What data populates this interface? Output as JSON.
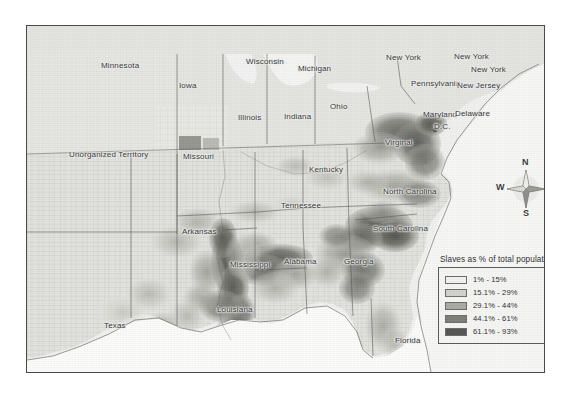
{
  "map": {
    "title": "Slaves as % of total population",
    "frame_border_color": "#4a4a4a",
    "land_base_color": "#e8e8e4",
    "water_color": "#fbfbfa",
    "labels": [
      {
        "name": "minnesota",
        "text": "Minnesota",
        "x": 74,
        "y": 35
      },
      {
        "name": "wisconsin",
        "text": "Wisconsin",
        "x": 219,
        "y": 31
      },
      {
        "name": "michigan",
        "text": "Michigan",
        "x": 271,
        "y": 38
      },
      {
        "name": "new-york-west",
        "text": "New York",
        "x": 359,
        "y": 27
      },
      {
        "name": "new-york-center",
        "text": "New York",
        "x": 427,
        "y": 26
      },
      {
        "name": "new-york-east",
        "text": "New York",
        "x": 444,
        "y": 39
      },
      {
        "name": "iowa",
        "text": "Iowa",
        "x": 152,
        "y": 55
      },
      {
        "name": "pennsylvania",
        "text": "Pennsylvania",
        "x": 384,
        "y": 53
      },
      {
        "name": "new-jersey",
        "text": "New Jersey",
        "x": 430,
        "y": 55
      },
      {
        "name": "illinois",
        "text": "Illinois",
        "x": 211,
        "y": 87
      },
      {
        "name": "indiana",
        "text": "Indiana",
        "x": 257,
        "y": 86
      },
      {
        "name": "ohio",
        "text": "Ohio",
        "x": 303,
        "y": 76
      },
      {
        "name": "maryland",
        "text": "Maryland",
        "x": 396,
        "y": 84
      },
      {
        "name": "delaware",
        "text": "Delaware",
        "x": 428,
        "y": 83
      },
      {
        "name": "dc",
        "text": "D.C.",
        "x": 407,
        "y": 96
      },
      {
        "name": "unorganized-territory",
        "text": "Unorganized Territory",
        "x": 42,
        "y": 124
      },
      {
        "name": "missouri",
        "text": "Missouri",
        "x": 156,
        "y": 126
      },
      {
        "name": "kentucky",
        "text": "Kentucky",
        "x": 282,
        "y": 139
      },
      {
        "name": "virginia",
        "text": "Virginal",
        "x": 358,
        "y": 112
      },
      {
        "name": "tennessee",
        "text": "Tennessee",
        "x": 254,
        "y": 175
      },
      {
        "name": "north-carolina",
        "text": "North Carolina",
        "x": 356,
        "y": 161
      },
      {
        "name": "arkansas",
        "text": "Arkansas",
        "x": 155,
        "y": 201
      },
      {
        "name": "south-carolina",
        "text": "South Carolina",
        "x": 346,
        "y": 198
      },
      {
        "name": "mississippi",
        "text": "Mississippi",
        "x": 203,
        "y": 234
      },
      {
        "name": "alabama",
        "text": "Alabama",
        "x": 257,
        "y": 231
      },
      {
        "name": "georgia",
        "text": "Georgia",
        "x": 317,
        "y": 231
      },
      {
        "name": "louisiana",
        "text": "Louisiana",
        "x": 190,
        "y": 279
      },
      {
        "name": "texas",
        "text": "Texas",
        "x": 77,
        "y": 295
      },
      {
        "name": "florida",
        "text": "Florida",
        "x": 368,
        "y": 310
      }
    ]
  },
  "compass": {
    "north": "N",
    "south": "S",
    "east": "E",
    "west": "W"
  },
  "legend": {
    "title": "Slaves as % of total population",
    "entries": [
      {
        "label": "1% - 15%",
        "color": "#f2f2ef"
      },
      {
        "label": "15.1% - 29%",
        "color": "#d2d2cd"
      },
      {
        "label": "29.1% - 44%",
        "color": "#aaaaa4"
      },
      {
        "label": "44.1% - 61%",
        "color": "#7e7e78"
      },
      {
        "label": "61.1% - 93%",
        "color": "#545450"
      }
    ]
  },
  "chart_data": {
    "type": "heatmap",
    "title": "Slaves as % of total population",
    "subtitle": "",
    "xlabel": "",
    "ylabel": "",
    "legend_position": "bottom-right",
    "grid": false,
    "classes": [
      {
        "range": "1% - 15%",
        "min": 1.0,
        "max": 15.0,
        "color": "#f2f2ef"
      },
      {
        "range": "15.1% - 29%",
        "min": 15.1,
        "max": 29.0,
        "color": "#d2d2cd"
      },
      {
        "range": "29.1% - 44%",
        "min": 29.1,
        "max": 44.0,
        "color": "#aaaaa4"
      },
      {
        "range": "44.1% - 61%",
        "min": 44.1,
        "max": 61.0,
        "color": "#7e7e78"
      },
      {
        "range": "61.1% - 93%",
        "min": 61.1,
        "max": 93.0,
        "color": "#545450"
      }
    ],
    "categories": [
      "Minnesota",
      "Wisconsin",
      "Michigan",
      "New York",
      "Iowa",
      "Pennsylvania",
      "New Jersey",
      "Illinois",
      "Indiana",
      "Ohio",
      "Maryland",
      "Delaware",
      "D.C.",
      "Unorganized Territory",
      "Missouri",
      "Kentucky",
      "Virginal",
      "Tennessee",
      "North Carolina",
      "Arkansas",
      "South Carolina",
      "Mississippi",
      "Alabama",
      "Georgia",
      "Louisiana",
      "Texas",
      "Florida"
    ],
    "values": [
      0,
      0,
      0,
      0,
      0,
      0,
      0,
      0,
      0,
      0,
      13,
      2,
      2,
      0,
      10,
      20,
      31,
      25,
      33,
      26,
      57,
      55,
      45,
      44,
      47,
      30,
      44
    ],
    "annotation": "County-level choropleth of the 1860 southern United States; darkest shading marks the Mississippi Delta, Alabama Black Belt, and South Carolina / Georgia low country."
  }
}
